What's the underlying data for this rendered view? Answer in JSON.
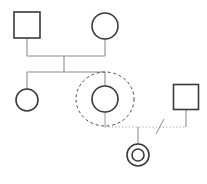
{
  "diagram": {
    "type": "genogram",
    "canvas": {
      "width": 207,
      "height": 184,
      "background": "#ffffff"
    },
    "colors": {
      "person_stroke": "#3a3a3a",
      "line_stroke": "#8c8c8c",
      "dashed_stroke": "#4a4a4a",
      "dotted_stroke": "#9a9a9a",
      "fill": "#ffffff"
    },
    "stroke_widths": {
      "person": 1.6,
      "line": 1.1,
      "dashed": 1.0,
      "dotted": 1.0
    },
    "nodes": [
      {
        "id": "father",
        "shape": "square",
        "gender": "male",
        "generation": 1,
        "cx": 27,
        "cy": 25,
        "size": 26,
        "emphasis": "none",
        "label": ""
      },
      {
        "id": "mother",
        "shape": "circle",
        "gender": "female",
        "generation": 1,
        "cx": 105,
        "cy": 26,
        "r": 13,
        "emphasis": "none",
        "label": ""
      },
      {
        "id": "daughter-one",
        "shape": "circle",
        "gender": "female",
        "generation": 2,
        "cx": 27,
        "cy": 100,
        "r": 11,
        "emphasis": "none",
        "label": ""
      },
      {
        "id": "index-person",
        "shape": "circle",
        "gender": "female",
        "generation": 2,
        "cx": 105,
        "cy": 99,
        "r": 13,
        "emphasis": "dashed-ellipse",
        "label": ""
      },
      {
        "id": "partner-male",
        "shape": "square",
        "gender": "male",
        "generation": 2,
        "cx": 186,
        "cy": 97,
        "size": 25,
        "emphasis": "none",
        "label": ""
      },
      {
        "id": "child-double-circle",
        "shape": "double-circle",
        "gender": "female",
        "generation": 3,
        "cx": 138,
        "cy": 155,
        "r_outer": 11,
        "r_inner": 6,
        "emphasis": "none",
        "label": ""
      }
    ],
    "household_ellipse": {
      "id": "household-boundary",
      "cx": 105,
      "cy": 99,
      "rx": 29,
      "ry": 27,
      "style": "dashed",
      "dash_pattern": "3,2.6"
    },
    "edges": [
      {
        "id": "marriage-union-gen1",
        "type": "marriage",
        "style": "solid",
        "from": "father",
        "to": "mother",
        "drop_from_y": 38,
        "union_line_y": 56,
        "left_x": 27,
        "right_x": 105,
        "midpoint_x": 64
      },
      {
        "id": "sibship-bar-gen2",
        "type": "sibship",
        "style": "solid",
        "union_midpoint_x": 64,
        "union_line_y": 56,
        "sibship_line_y": 72,
        "left_x": 27,
        "right_x": 105,
        "children": [
          "daughter-one",
          "index-person"
        ]
      },
      {
        "id": "partnership-index-partner",
        "type": "partnership-separated",
        "style": "dotted",
        "line_y": 127,
        "left_x": 105,
        "right_x": 186,
        "left_drop_from_y": 112,
        "right_drop_from_y": 110,
        "slash_marks": 1,
        "slash_x": 160
      },
      {
        "id": "child-link-gen3",
        "type": "child",
        "style": "solid",
        "from_x": 138,
        "from_y": 127,
        "to_x": 138,
        "to_y": 144,
        "child": "child-double-circle"
      }
    ],
    "legend": {
      "square_meaning": "male",
      "circle_meaning": "female",
      "double_circle_meaning": "identified patient",
      "dashed_ellipse_meaning": "household",
      "dotted_line_meaning": "non-marital relationship",
      "slash_meaning": "separation"
    }
  }
}
